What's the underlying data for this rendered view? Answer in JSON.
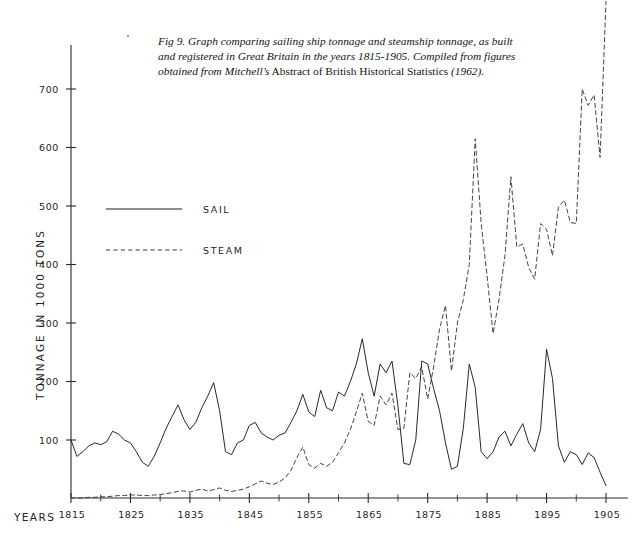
{
  "caption": {
    "figure_number": "Fig 9.",
    "text_part1": "Graph comparing sailing ship tonnage and steamship tonnage, as built and registered in Great Britain in the years 1815-1905. Compiled from figures obtained from ",
    "source_italic": "Mitchell’s",
    "source_roman": " Abstract of British Historical Statistics ",
    "source_year": "(1962)."
  },
  "axes": {
    "y_title": "TONNAGE IN 1000 TONS",
    "x_title": "YEARS",
    "y_ticks": [
      100,
      200,
      300,
      400,
      500,
      600,
      700
    ],
    "x_major_ticks": [
      1815,
      1825,
      1835,
      1845,
      1855,
      1865,
      1875,
      1885,
      1895,
      1905
    ],
    "x_minor_ticks": [
      1820,
      1830,
      1840,
      1850,
      1860,
      1870,
      1880,
      1890,
      1900
    ],
    "x_tick_labels": [
      "1815",
      "1825",
      "1835",
      "1845",
      "1855",
      "1865",
      "1875",
      "1885",
      "1895",
      "1905"
    ],
    "y_tick_labels": [
      "100",
      "200",
      "300",
      "400",
      "500",
      "600",
      "700"
    ]
  },
  "legend": {
    "position": "upper-left-inside",
    "entries": [
      {
        "label": "SAIL",
        "style": "solid",
        "color": "#1e1e1e"
      },
      {
        "label": "STEAM",
        "style": "dashed",
        "color": "#3a3a3a"
      }
    ]
  },
  "colors": {
    "sail": "#1e1e1e",
    "steam": "#3a3a3a",
    "axis": "#2b2b2b",
    "background": "#ffffff"
  },
  "chart_data": {
    "type": "line",
    "title": "Graph comparing sailing ship tonnage and steamship tonnage, as built and registered in Great Britain in the years 1815-1905",
    "xlabel": "YEARS",
    "ylabel": "TONNAGE IN 1000 TONS",
    "xlim": [
      1815,
      1906
    ],
    "ylim": [
      0,
      800
    ],
    "grid": false,
    "legend_position": "upper-left-inside",
    "x": [
      1815,
      1816,
      1817,
      1818,
      1819,
      1820,
      1821,
      1822,
      1823,
      1824,
      1825,
      1826,
      1827,
      1828,
      1829,
      1830,
      1831,
      1832,
      1833,
      1834,
      1835,
      1836,
      1837,
      1838,
      1839,
      1840,
      1841,
      1842,
      1843,
      1844,
      1845,
      1846,
      1847,
      1848,
      1849,
      1850,
      1851,
      1852,
      1853,
      1854,
      1855,
      1856,
      1857,
      1858,
      1859,
      1860,
      1861,
      1862,
      1863,
      1864,
      1865,
      1866,
      1867,
      1868,
      1869,
      1870,
      1871,
      1872,
      1873,
      1874,
      1875,
      1876,
      1877,
      1878,
      1879,
      1880,
      1881,
      1882,
      1883,
      1884,
      1885,
      1886,
      1887,
      1888,
      1889,
      1890,
      1891,
      1892,
      1893,
      1894,
      1895,
      1896,
      1897,
      1898,
      1899,
      1900,
      1901,
      1902,
      1903,
      1904,
      1905
    ],
    "series": [
      {
        "name": "SAIL",
        "style": "solid",
        "color": "#1e1e1e",
        "values": [
          100,
          72,
          80,
          90,
          95,
          92,
          97,
          115,
          110,
          100,
          95,
          80,
          62,
          55,
          72,
          95,
          120,
          140,
          160,
          135,
          118,
          130,
          155,
          175,
          198,
          150,
          80,
          75,
          95,
          100,
          125,
          130,
          112,
          105,
          100,
          108,
          112,
          130,
          150,
          178,
          148,
          140,
          185,
          155,
          150,
          182,
          175,
          200,
          230,
          273,
          215,
          175,
          230,
          215,
          235,
          158,
          60,
          58,
          100,
          235,
          230,
          188,
          150,
          95,
          50,
          55,
          120,
          230,
          190,
          80,
          68,
          80,
          105,
          115,
          90,
          110,
          128,
          95,
          80,
          118,
          255,
          205,
          90,
          62,
          80,
          75,
          58,
          78,
          70,
          45,
          22
        ]
      },
      {
        "name": "STEAM",
        "style": "dashed",
        "color": "#3a3a3a",
        "values": [
          1,
          1,
          1,
          2,
          2,
          3,
          3,
          4,
          5,
          5,
          6,
          6,
          5,
          5,
          6,
          7,
          8,
          10,
          12,
          13,
          11,
          14,
          16,
          13,
          15,
          18,
          14,
          12,
          14,
          16,
          20,
          25,
          30,
          26,
          24,
          28,
          35,
          48,
          70,
          88,
          58,
          52,
          60,
          55,
          62,
          78,
          95,
          118,
          148,
          180,
          132,
          125,
          175,
          160,
          180,
          118,
          120,
          215,
          205,
          225,
          170,
          225,
          290,
          330,
          218,
          300,
          340,
          400,
          615,
          470,
          380,
          282,
          340,
          415,
          550,
          430,
          435,
          395,
          375,
          470,
          460,
          415,
          498,
          510,
          472,
          470,
          700,
          672,
          690,
          583,
          850
        ]
      }
    ]
  }
}
